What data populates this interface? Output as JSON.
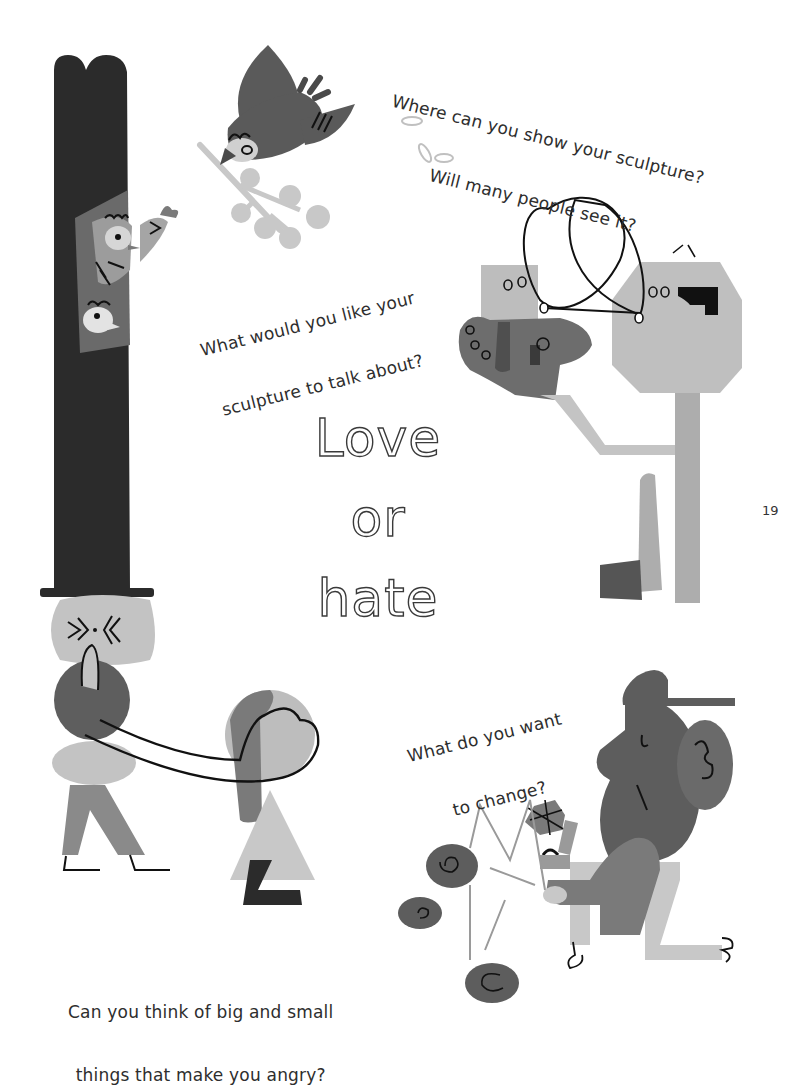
{
  "page": {
    "number": "19",
    "background": "#ffffff"
  },
  "title": {
    "words": [
      "Love",
      "or",
      "hate"
    ],
    "style": "outlined"
  },
  "prompts": {
    "sculpture_location": {
      "line1": "Where can you show your sculpture?",
      "line2": "Will many people see it?"
    },
    "sculpture_topic": {
      "line1": "What would you like your",
      "line2": "sculpture to talk about?"
    },
    "change": {
      "line1": "What do you want",
      "line2": "to change?"
    },
    "angry": {
      "line1": "Can you think of big and small",
      "line2": "things that make you angry?"
    }
  },
  "illustrations": [
    "tall-hat-figure-with-birds",
    "bird-carrying-berry-branch",
    "two-heads-talking-figure",
    "figure-holding-hand-on-head",
    "seated-figure-with-cap-and-mobile"
  ],
  "colors": {
    "dark": "#2b2b2b",
    "mid_dark": "#5a5a5a",
    "mid": "#808080",
    "light": "#b4b4b4",
    "lighter": "#c8c8c8",
    "ink": "#111111"
  }
}
